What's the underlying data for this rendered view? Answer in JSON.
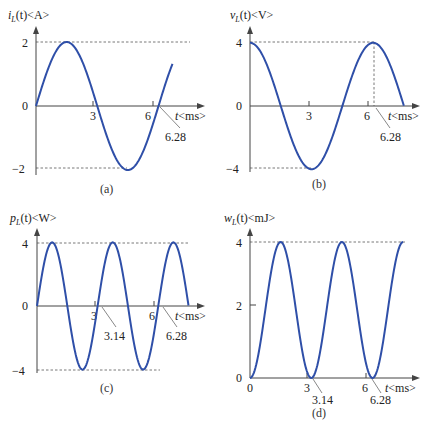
{
  "chart_data": [
    {
      "id": "a",
      "type": "line",
      "caption": "(a)",
      "ylabel_var": "i",
      "ylabel_sub": "L",
      "ylabel_rest": "(t)<A>",
      "xlabel": "t<ms>",
      "formula": "2*sin(t)",
      "amplitude": 2,
      "t_range": [
        0,
        7.0
      ],
      "yticks": [
        2,
        0,
        -2
      ],
      "ytick_labels": [
        "2",
        "0",
        "−2"
      ],
      "xticks": [
        3,
        6
      ],
      "xtick_labels": [
        "3",
        "6"
      ],
      "annotations": [
        "6.28"
      ],
      "series": [
        {
          "name": "i_L(t)",
          "x": [
            0,
            1.57,
            3.14,
            4.71,
            6.28,
            7.0
          ],
          "y": [
            0,
            2,
            0,
            -2,
            0,
            1.31
          ]
        }
      ],
      "ylim": [
        -2,
        2
      ]
    },
    {
      "id": "b",
      "type": "line",
      "caption": "(b)",
      "ylabel_var": "v",
      "ylabel_sub": "L",
      "ylabel_rest": "(t)<V>",
      "xlabel": "t<ms>",
      "formula": "4*cos(t)",
      "amplitude": 4,
      "t_range": [
        0,
        7.85
      ],
      "yticks": [
        4,
        0,
        -4
      ],
      "ytick_labels": [
        "4",
        "0",
        "−4"
      ],
      "xticks": [
        3,
        6
      ],
      "xtick_labels": [
        "3",
        "6"
      ],
      "annotations": [
        "6.28"
      ],
      "series": [
        {
          "name": "v_L(t)",
          "x": [
            0,
            1.57,
            3.14,
            4.71,
            6.28,
            7.85
          ],
          "y": [
            4,
            0,
            -4,
            0,
            4,
            0
          ]
        }
      ],
      "ylim": [
        -4,
        4
      ]
    },
    {
      "id": "c",
      "type": "line",
      "caption": "(c)",
      "ylabel_var": "p",
      "ylabel_sub": "L",
      "ylabel_rest": "(t)<W>",
      "xlabel": "t<ms>",
      "formula": "4*sin(2t)",
      "amplitude": 4,
      "t_range": [
        0,
        7.85
      ],
      "yticks": [
        4,
        0,
        -4
      ],
      "ytick_labels": [
        "4",
        "0",
        "−4"
      ],
      "xticks": [
        3,
        6
      ],
      "xtick_labels": [
        "3",
        "6"
      ],
      "annotations": [
        "3.14",
        "6.28"
      ],
      "series": [
        {
          "name": "p_L(t)",
          "x": [
            0,
            0.785,
            1.57,
            2.355,
            3.14,
            3.925,
            4.71,
            5.495,
            6.28,
            7.065,
            7.85
          ],
          "y": [
            0,
            4,
            0,
            -4,
            0,
            4,
            0,
            -4,
            0,
            4,
            0
          ]
        }
      ],
      "ylim": [
        -4,
        4
      ]
    },
    {
      "id": "d",
      "type": "line",
      "caption": "(d)",
      "ylabel_var": "w",
      "ylabel_sub": "L",
      "ylabel_rest": "(t)<mJ>",
      "xlabel": "t<ms>",
      "formula": "4*sin^2(t)",
      "amplitude": 4,
      "t_range": [
        0,
        7.85
      ],
      "yticks": [
        4,
        2,
        0
      ],
      "ytick_labels": [
        "4",
        "2",
        "0"
      ],
      "xticks": [
        0,
        3,
        6
      ],
      "xtick_labels": [
        "0",
        "3",
        "6"
      ],
      "annotations": [
        "3.14",
        "6.28"
      ],
      "series": [
        {
          "name": "w_L(t)",
          "x": [
            0,
            1.57,
            3.14,
            4.71,
            6.28,
            7.85
          ],
          "y": [
            0,
            4,
            0,
            4,
            0,
            4
          ]
        }
      ],
      "ylim": [
        0,
        4
      ]
    }
  ]
}
